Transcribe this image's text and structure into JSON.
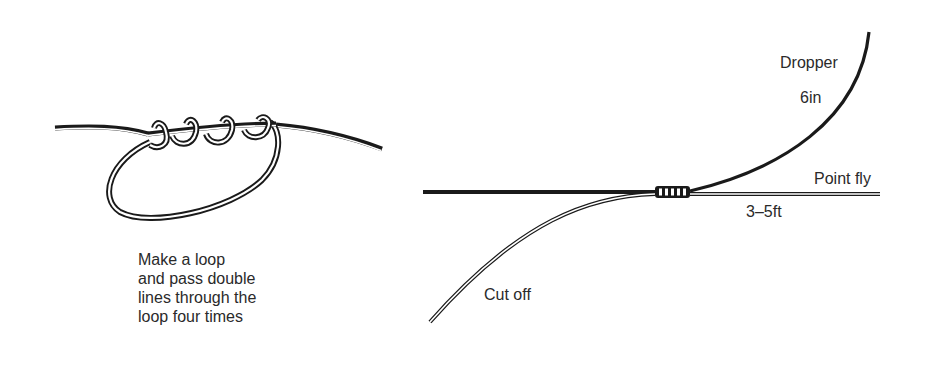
{
  "figure": {
    "left_panel": {
      "title": "Loop with double line wraps",
      "caption_lines": [
        "Make a loop",
        "and pass double",
        "lines through the",
        "loop four times"
      ],
      "wraps": 4
    },
    "right_panel": {
      "labels": {
        "dropper": "Dropper",
        "dropper_length": "6in",
        "point_fly": "Point fly",
        "point_fly_length": "3–5ft",
        "cut_off": "Cut off"
      }
    }
  },
  "colors": {
    "line_dark": "#1a1a1a",
    "line_light": "#ffffff",
    "text": "#2a2a2a",
    "background": "#ffffff"
  }
}
